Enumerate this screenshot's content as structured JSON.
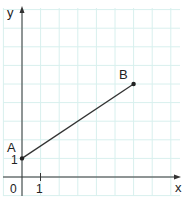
{
  "chart_data": {
    "type": "line",
    "title": "",
    "xlabel": "x",
    "ylabel": "y",
    "x_ticks": [
      "0",
      "1"
    ],
    "y_ticks": [
      "1"
    ],
    "grid": true,
    "xlim": [
      -1,
      8
    ],
    "ylim": [
      -1,
      9
    ],
    "points": [
      {
        "label": "A",
        "x": 0,
        "y": 1
      },
      {
        "label": "B",
        "x": 6,
        "y": 5
      }
    ],
    "series": [
      {
        "name": "AB",
        "x": [
          0,
          6
        ],
        "y": [
          1,
          5
        ]
      }
    ]
  },
  "labels": {
    "x_axis": "x",
    "y_axis": "y",
    "origin": "0",
    "x_tick_1": "1",
    "y_tick_1": "1",
    "point_a": "A",
    "point_b": "B"
  },
  "colors": {
    "grid": "#d8f0ee",
    "axis": "#333333",
    "segment": "#333333"
  }
}
